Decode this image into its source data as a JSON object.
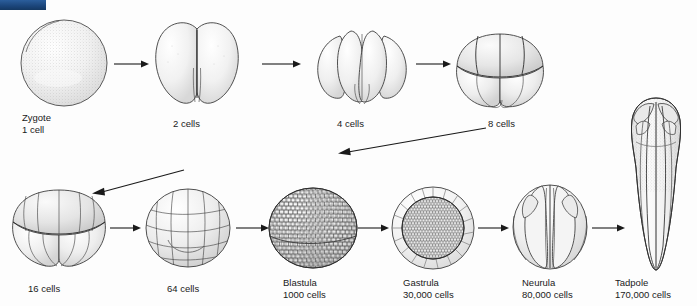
{
  "figure": {
    "background_color": "#fdfdfd",
    "ink_color": "#2b2b2b",
    "corner_bar_color": "#1f4e86"
  },
  "stages": [
    {
      "id": "zygote",
      "name": "Zygote",
      "count": "1 cell",
      "row": "top",
      "label_x": 22,
      "label_y": 112
    },
    {
      "id": "two",
      "name": "2 cells",
      "count": "",
      "row": "top",
      "label_x": 173,
      "label_y": 118
    },
    {
      "id": "four",
      "name": "4 cells",
      "count": "",
      "row": "top",
      "label_x": 337,
      "label_y": 118
    },
    {
      "id": "eight",
      "name": "8 cells",
      "count": "",
      "row": "top",
      "label_x": 488,
      "label_y": 118
    },
    {
      "id": "sixteen",
      "name": "16 cells",
      "count": "",
      "row": "bottom",
      "label_x": 28,
      "label_y": 283
    },
    {
      "id": "sixtyfour",
      "name": "64 cells",
      "count": "",
      "row": "bottom",
      "label_x": 167,
      "label_y": 283
    },
    {
      "id": "blastula",
      "name": "Blastula",
      "count": "1000 cells",
      "row": "bottom",
      "label_x": 283,
      "label_y": 277
    },
    {
      "id": "gastrula",
      "name": "Gastrula",
      "count": "30,000 cells",
      "row": "bottom",
      "label_x": 403,
      "label_y": 277
    },
    {
      "id": "neurula",
      "name": "Neurula",
      "count": "80,000 cells",
      "row": "bottom",
      "label_x": 522,
      "label_y": 277
    },
    {
      "id": "tadpole",
      "name": "Tadpole",
      "count": "170,000 cells",
      "row": "bottom",
      "label_x": 615,
      "label_y": 277
    }
  ],
  "arrows": [
    {
      "id": "zygote-to-2",
      "from": "zygote",
      "to": "two"
    },
    {
      "id": "2-to-4",
      "from": "two",
      "to": "four"
    },
    {
      "id": "4-to-8",
      "from": "four",
      "to": "eight"
    },
    {
      "id": "8-to-16-wrap",
      "from": "eight",
      "to": "sixteen"
    },
    {
      "id": "64-to-16",
      "from": "sixtyfour",
      "to": "sixteen"
    },
    {
      "id": "16-to-64",
      "from": "sixteen",
      "to": "sixtyfour"
    },
    {
      "id": "64-to-blastula",
      "from": "sixtyfour",
      "to": "blastula"
    },
    {
      "id": "blastula-to-gastrula",
      "from": "blastula",
      "to": "gastrula"
    },
    {
      "id": "gastrula-to-neurula",
      "from": "gastrula",
      "to": "neurula"
    },
    {
      "id": "neurula-to-tadpole",
      "from": "neurula",
      "to": "tadpole"
    }
  ]
}
